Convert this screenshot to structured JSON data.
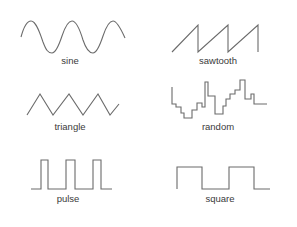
{
  "waveforms": [
    {
      "id": "sine",
      "label": "sine",
      "column": 0,
      "row": 0
    },
    {
      "id": "sawtooth",
      "label": "sawtooth",
      "column": 1,
      "row": 0
    },
    {
      "id": "triangle",
      "label": "triangle",
      "column": 0,
      "row": 1
    },
    {
      "id": "random",
      "label": "random",
      "column": 1,
      "row": 1
    },
    {
      "id": "pulse",
      "label": "pulse",
      "column": 0,
      "row": 2
    },
    {
      "id": "square",
      "label": "square",
      "column": 1,
      "row": 2
    }
  ],
  "style": {
    "line_color": "#6b6b6b",
    "text_color": "#3a3a3a",
    "background": "#ffffff"
  }
}
